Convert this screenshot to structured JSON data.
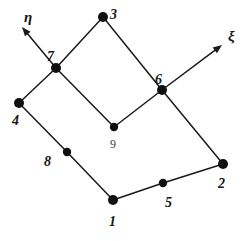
{
  "figure": {
    "width": 245,
    "height": 241,
    "background_color": "#ffffff",
    "line_color": "#1a1a1a",
    "node_fill_color": "#101010",
    "label_color": "#151515"
  },
  "nodes": [
    {
      "id": "1",
      "label": "1",
      "role": "corner",
      "x": 113,
      "y": 200,
      "r": 5.0,
      "label_x": 109,
      "label_y": 215
    },
    {
      "id": "2",
      "label": "2",
      "role": "corner",
      "x": 223,
      "y": 164,
      "r": 5.0,
      "label_x": 218,
      "label_y": 177
    },
    {
      "id": "3",
      "label": "3",
      "role": "corner",
      "x": 103,
      "y": 17,
      "r": 5.0,
      "label_x": 110,
      "label_y": 8
    },
    {
      "id": "4",
      "label": "4",
      "role": "corner",
      "x": 19,
      "y": 103,
      "r": 5.0,
      "label_x": 12,
      "label_y": 114
    },
    {
      "id": "5",
      "label": "5",
      "role": "midside",
      "x": 163,
      "y": 183,
      "r": 4.2,
      "label_x": 165,
      "label_y": 196
    },
    {
      "id": "6",
      "label": "6",
      "role": "midside",
      "x": 162,
      "y": 90,
      "r": 5.0,
      "label_x": 155,
      "label_y": 73
    },
    {
      "id": "7",
      "label": "7",
      "role": "midside",
      "x": 56,
      "y": 68,
      "r": 5.0,
      "label_x": 47,
      "label_y": 50
    },
    {
      "id": "8",
      "label": "8",
      "role": "midside",
      "x": 67,
      "y": 152,
      "r": 4.2,
      "label_x": 44,
      "label_y": 155
    },
    {
      "id": "9",
      "label": "9",
      "role": "center",
      "x": 114,
      "y": 127,
      "r": 4.2,
      "label_x": 110,
      "label_y": 138
    }
  ],
  "edges": [
    {
      "name": "edge-4-7",
      "from": "4",
      "to": "7"
    },
    {
      "name": "edge-7-3",
      "from": "7",
      "to": "3"
    },
    {
      "name": "edge-3-6",
      "from": "3",
      "to": "6"
    },
    {
      "name": "edge-6-2",
      "from": "6",
      "to": "2"
    },
    {
      "name": "edge-2-5",
      "from": "2",
      "to": "5"
    },
    {
      "name": "edge-5-1",
      "from": "5",
      "to": "1"
    },
    {
      "name": "edge-1-8",
      "from": "1",
      "to": "8"
    },
    {
      "name": "edge-8-4",
      "from": "8",
      "to": "4"
    },
    {
      "name": "edge-7-9",
      "from": "7",
      "to": "9"
    },
    {
      "name": "edge-9-6",
      "from": "9",
      "to": "6"
    }
  ],
  "axes": [
    {
      "name": "eta",
      "symbol": "η",
      "origin_x": 56,
      "origin_y": 68,
      "tip_x": 22,
      "tip_y": 27,
      "label_x": 24,
      "label_y": 10
    },
    {
      "name": "xi",
      "symbol": "ξ",
      "origin_x": 162,
      "origin_y": 90,
      "tip_x": 222,
      "tip_y": 45,
      "label_x": 228,
      "label_y": 29
    }
  ]
}
